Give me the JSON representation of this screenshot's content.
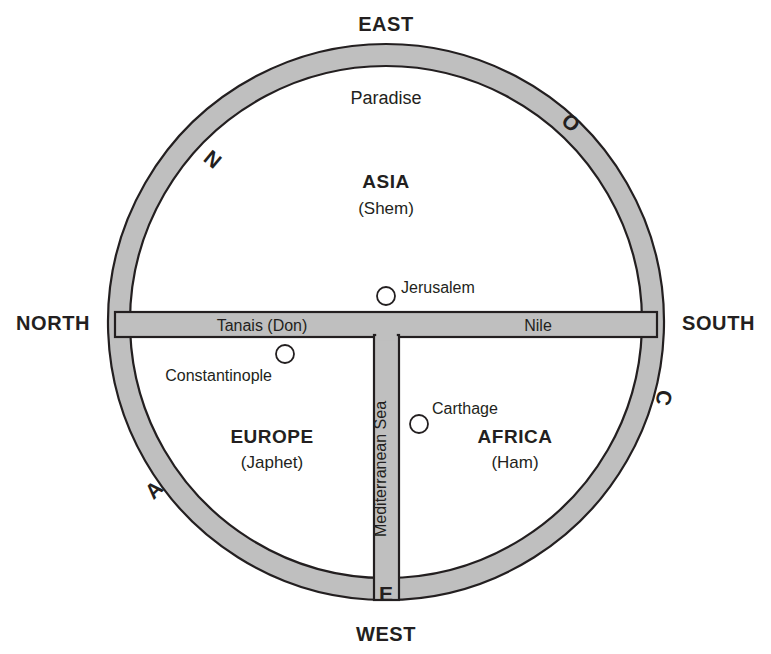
{
  "figure": {
    "colors": {
      "land_fill": "#ffffff",
      "band_fill": "#bfbfbf",
      "outline": "#231f20",
      "text": "#231f20",
      "background": "#ffffff"
    }
  },
  "compass": {
    "east": "EAST",
    "west": "WEST",
    "north": "NORTH",
    "south": "SOUTH"
  },
  "ocean_ring": {
    "letters": [
      {
        "char": "O",
        "position": "upper-right"
      },
      {
        "char": "C",
        "position": "right"
      },
      {
        "char": "E",
        "position": "bottom"
      },
      {
        "char": "A",
        "position": "lower-left"
      },
      {
        "char": "N",
        "position": "upper-left"
      }
    ],
    "word": "OCEAN"
  },
  "continents": [
    {
      "name": "ASIA",
      "son": "(Shem)",
      "quadrant": "top"
    },
    {
      "name": "EUROPE",
      "son": "(Japhet)",
      "quadrant": "bottom-left"
    },
    {
      "name": "AFRICA",
      "son": "(Ham)",
      "quadrant": "bottom-right"
    }
  ],
  "waters": {
    "tanais": "Tanais (Don)",
    "nile": "Nile",
    "mediterranean": "Mediterranean Sea"
  },
  "places": [
    {
      "name": "Paradise",
      "kind": "region",
      "marker": false
    },
    {
      "name": "Jerusalem",
      "kind": "city",
      "marker": true
    },
    {
      "name": "Constantinople",
      "kind": "city",
      "marker": true
    },
    {
      "name": "Carthage",
      "kind": "city",
      "marker": true
    }
  ]
}
